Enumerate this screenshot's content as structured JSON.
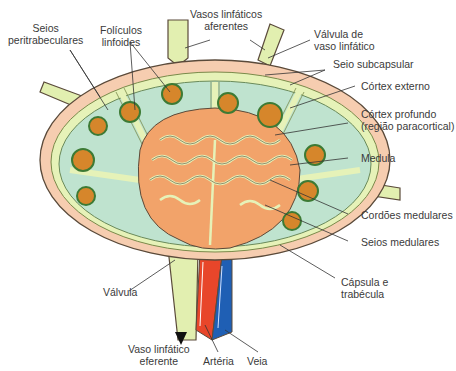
{
  "diagram": {
    "labels": {
      "seios_peritrabeculares": [
        "Seios",
        "peritrabeculares"
      ],
      "foliculos_linfoides": [
        "Folículos",
        "linfoides"
      ],
      "vasos_linfaticos_aferentes": [
        "Vasos linfáticos",
        "aferentes"
      ],
      "valvula_vaso_linfatico": [
        "Válvula de",
        "vaso linfático"
      ],
      "seio_subcapsular": "Seio subcapsular",
      "cortex_externo": "Córtex externo",
      "cortex_profundo": [
        "Córtex profundo",
        "(região paracortical)"
      ],
      "medula": "Medula",
      "cordoes_medulares": "Cordões medulares",
      "seios_medulares": "Seios medulares",
      "capsula_trabecula": [
        "Cápsula e",
        "trabécula"
      ],
      "valvula": "Válvula",
      "vaso_linfatico_eferente": [
        "Vaso linfático",
        "eferente"
      ],
      "arteria": "Artéria",
      "veia": "Veia"
    },
    "colors": {
      "capsule": "#f6cdb0",
      "subcapsular_sinus": "#e6f2b8",
      "cortex": "#bfe3cf",
      "medulla": "#f2a36a",
      "follicle_fill": "#d6862b",
      "follicle_ring": "#3d7a34",
      "artery": "#e8462a",
      "vein": "#1f5fb4",
      "lymph_vessel": "#e2efb0",
      "outline": "#5a4a3a"
    }
  }
}
